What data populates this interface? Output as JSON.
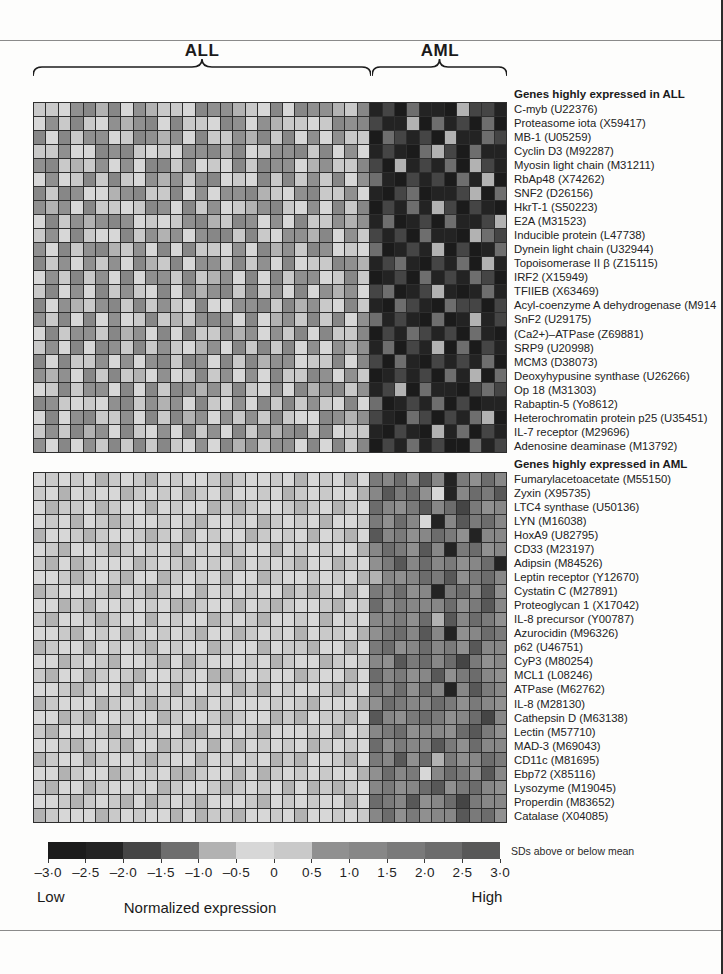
{
  "figure": {
    "group_labels": {
      "all": "ALL",
      "aml": "AML"
    },
    "legend": {
      "scale_note": "SDs above or below mean",
      "low": "Low",
      "high": "High",
      "axis_label": "Normalized expression",
      "ticks": [
        "–3·0",
        "–2·5",
        "–2·0",
        "–1·5",
        "–1·0",
        "–0·5",
        "0",
        "0·5",
        "1·0",
        "1·5",
        "2·0",
        "2·5",
        "3·0"
      ]
    }
  },
  "chart_data": {
    "type": "heatmap",
    "columns": {
      "all_samples": 27,
      "aml_samples": 11,
      "total": 38
    },
    "column_groups": [
      "ALL",
      "AML"
    ],
    "value_scale": {
      "min": -3.0,
      "max": 3.0,
      "step": 0.5,
      "units": "SDs above or below mean",
      "low_text": "Low",
      "high_text": "High",
      "axis": "Normalized expression"
    },
    "cell_encoding": "one hex digit (0-B) per sample column; bin 0 = −3·0..−2·5 SD up to bin B = 2·5..3·0 SD",
    "colormap_grays": [
      "#1b1b1b",
      "#232323",
      "#454545",
      "#6e6e6e",
      "#b2b2b2",
      "#d7d7d7",
      "#c9c9c9",
      "#909090",
      "#878787",
      "#7a7a7a",
      "#6c6c6c",
      "#585858"
    ],
    "grid_line_color": "#2e2e2e",
    "blocks": [
      {
        "header": "Genes highly expressed in ALL",
        "genes": [
          "C-myb (U22376)",
          "Proteasome iota (X59417)",
          "MB-1 (U05259)",
          "Cyclin D3 (M92287)",
          "Myosin light chain (M31211)",
          "RbAp48 (X74262)",
          "SNF2 (D26156)",
          "HkrT-1 (S50223)",
          "E2A (M31523)",
          "Inducible protein (L47738)",
          "Dynein light chain (U32944)",
          "Topoisomerase II β (Z15115)",
          "IRF2 (X15949)",
          "TFIIEB (X63469)",
          "Acyl-coenzyme A dehydrogenase (M914",
          "SnF2 (U29175)",
          "(Ca2+)–ATPase (Z69881)",
          "SRP9 (U20998)",
          "MCM3 (D38073)",
          "Deoxyhypusine synthase (U26266)",
          "Op 18 (M31303)",
          "Rabaptin-5 (Yo8612)",
          "Heterochromatin protein p25 (U35451)",
          "IL-7 receptor (M29696)",
          "Adenosine deaminase (M13792)"
        ],
        "rows": [
          "66578485746658774658587746812031104221",
          "57686574785866587574665687821140312030",
          "85867756874758667486857576603212041132",
          "66755878656577848567786857512103420311",
          "78646757588675658687754766820412130421",
          "57568686574767856586867685731021203140",
          "86875547866857577846578667510230112403",
          "74758665687586756478657586802131420210",
          "58674787565678468757586674713012031124",
          "67586558674757886865774857621203110432",
          "75867846758586657584768756530121402013",
          "86757675846857768675856687412310213041",
          "57686758577686475858677568601203121320",
          "68575867658574786867585747523012410131",
          "85746786867658557786847658610321032202",
          "76858575686467875854768685731210301412",
          "58677684758586674757685866802132120310",
          "67585876867654758686857574713021403021",
          "85866757578687586847756685820310212130",
          "74758686457568675758668757601212031403",
          "56867758586874768657584786712403110232",
          "87656578674758657586867658530121302011",
          "58578667586847576768655874721032021340",
          "67684758657586758674786856610210413021",
          "75857686868657584767758586802131200312"
        ]
      },
      {
        "header": "Genes highly expressed in AML",
        "genes": [
          "Fumarylacetoacetate (M55150)",
          "Zyxin (X95735)",
          "LTC4 synthase (U50136)",
          "LYN (M16038)",
          "HoxA9 (U82795)",
          "CD33 (M23197)",
          "Adipsin (M84526)",
          "Leptin receptor (Y12670)",
          "Cystatin C (M27891)",
          "Proteoglycan 1 (X17042)",
          "IL-8 precursor (Y00787)",
          "Azurocidin (M96326)",
          "p62 (U46751)",
          "CyP3 (M80254)",
          "MCL1 (L08246)",
          "ATPase (M62762)",
          "IL-8 (M28130)",
          "Cathepsin D (M63138)",
          "Lectin (M57710)",
          "MAD-3 (M69043)",
          "CD11c (M81695)",
          "Ebp72 (X85116)",
          "Lysozyme (M19045)",
          "Properdin (M83652)",
          "Catalase (X04085)"
        ],
        "rows": [
          "56565465645655646556545654598A7B8197A8",
          "6545655465654654556546565548B9A7518A9B",
          "546654655456554646556465465A879B8A2978",
          "56545646556564556546565455697A8518B9A8",
          "455646556465456554656545645B8978A97188",
          "5645564656545654655456565548A97B819A78",
          "64546555465645654565645546579B8A8978A1",
          "5564656455465654554655656544878A9B79A8",
          "46555645646554565655464654598A7819A8B7",
          "554645565654465545646556456A79888A79B8",
          "6455646554565546564556545658897A4B8A97",
          "55645654656564554656545665479A8B8178A9",
          "4655456564565546554566455459A78A897B88",
          "55465645564546555654655465687B9A8A2978",
          "645546564556654465655465545A8978B79A87",
          "55646554565455654645655646598A7A818B98",
          "4655546564656456555656455547A988A97987",
          "554645565546556465546456645B879A978A28",
          "64555645665544565645556545689A7887AB97",
          "556465645546654545656546565A7988B97A88",
          "46554655646554565654645564598B7A4978A9",
          "5546554656544655454656565547A8958A97B8",
          "6455465565465564656545464658978AB79A87",
          "556465645465645556456565545A98B78A2988",
          "4655546565545466455654556568A79788B9A7"
        ]
      }
    ]
  }
}
